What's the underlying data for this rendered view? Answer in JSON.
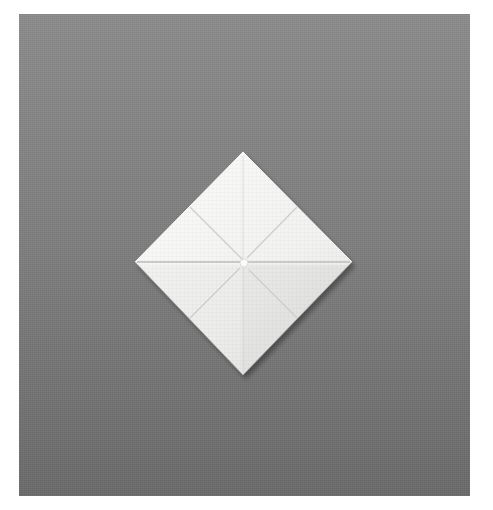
{
  "image": {
    "description": "Photograph of a white folded square napkin shaped like a diamond on a gray textured background",
    "colors": {
      "page_background": "#ffffff",
      "backdrop_top": "#8c8c8c",
      "backdrop_bottom": "#6b6b6b",
      "napkin_fill": "#f4f4f2",
      "napkin_shadow": "#d8d8d6",
      "fold_line": "#cfcfcd"
    },
    "napkin": {
      "shape": "diamond",
      "top": [
        243,
        152
      ],
      "right": [
        352,
        262
      ],
      "bottom": [
        243,
        375
      ],
      "left": [
        135,
        262
      ],
      "center": [
        243,
        262
      ]
    }
  }
}
